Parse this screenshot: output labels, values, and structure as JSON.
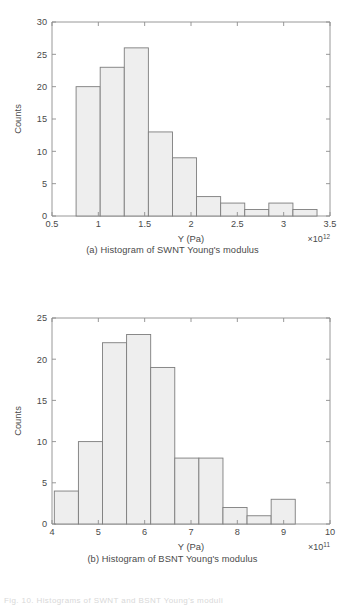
{
  "page": {
    "background": "#ffffff",
    "bar_fill": "#eeeeee",
    "bar_stroke": "#7d7d7d",
    "axis_color": "#8d8d8d",
    "text_color": "#4a4a4a",
    "partial_footer": "Fig. 10. Histograms of SWNT and BSNT Young's moduli"
  },
  "chart_data": [
    {
      "id": "a",
      "type": "bar",
      "title": "",
      "caption": "(a) Histogram of SWNT Young's modulus",
      "xlabel": "Y (Pa)",
      "ylabel": "Counts",
      "x_multiplier": "×10",
      "x_multiplier_exp": "12",
      "xlim": [
        0.5,
        3.5
      ],
      "ylim": [
        0,
        30
      ],
      "xticks": [
        0.5,
        1,
        1.5,
        2,
        2.5,
        3,
        3.5
      ],
      "xticklabels": [
        "0.5",
        "1",
        "1.5",
        "2",
        "2.5",
        "3",
        "3.5"
      ],
      "yticks": [
        0,
        5,
        10,
        15,
        20,
        25,
        30
      ],
      "yticklabels": [
        "0",
        "5",
        "10",
        "15",
        "20",
        "25",
        "30"
      ],
      "grid": false,
      "legend": "none",
      "bin_edges": [
        0.76,
        1.02,
        1.28,
        1.54,
        1.8,
        2.06,
        2.32,
        2.58,
        2.84,
        3.1,
        3.36
      ],
      "values": [
        20,
        23,
        26,
        13,
        9,
        3,
        2,
        1,
        2,
        1
      ],
      "bin_centers": [
        0.89,
        1.15,
        1.41,
        1.67,
        1.93,
        2.19,
        2.45,
        2.71,
        2.97,
        3.23
      ]
    },
    {
      "id": "b",
      "type": "bar",
      "title": "",
      "caption": "(b) Histogram of BSNT Young's modulus",
      "xlabel": "Y (Pa)",
      "ylabel": "Counts",
      "x_multiplier": "×10",
      "x_multiplier_exp": "11",
      "xlim": [
        4,
        10
      ],
      "ylim": [
        0,
        25
      ],
      "xticks": [
        4,
        5,
        6,
        7,
        8,
        9,
        10
      ],
      "xticklabels": [
        "4",
        "5",
        "6",
        "7",
        "8",
        "9",
        "10"
      ],
      "yticks": [
        0,
        5,
        10,
        15,
        20,
        25
      ],
      "yticklabels": [
        "0",
        "5",
        "10",
        "15",
        "20",
        "25"
      ],
      "grid": false,
      "legend": "none",
      "bin_edges": [
        4.05,
        4.57,
        5.09,
        5.61,
        6.13,
        6.65,
        7.17,
        7.69,
        8.21,
        8.73,
        9.25
      ],
      "values": [
        4,
        10,
        22,
        23,
        19,
        8,
        8,
        2,
        1,
        3
      ],
      "bin_centers": [
        4.31,
        4.83,
        5.35,
        5.87,
        6.39,
        6.91,
        7.43,
        7.95,
        8.47,
        8.99
      ]
    }
  ]
}
